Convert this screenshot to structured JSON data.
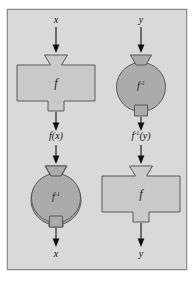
{
  "figure": {
    "frame": {
      "border_color": "#8d8d8d",
      "background_color": "#d9d9d9",
      "page_color": "#ffffff"
    },
    "colors": {
      "machine_f_fill": "#c9c9c9",
      "machine_f_inverse_fill": "#ababab",
      "outline": "#5a5a5a",
      "arrow": "#111111",
      "text": "#111111"
    }
  },
  "columns": [
    {
      "id": "left-chain",
      "description": "x enters f, yields f(x), which enters f inverse, returning x",
      "input_label": "x",
      "stage1_machine": "f",
      "intermediate_label_parts": {
        "base": "f(x)",
        "fn": "f",
        "arg": "(x)"
      },
      "stage2_machine": "f⁻¹",
      "output_label": "x"
    },
    {
      "id": "right-chain",
      "description": "y enters f inverse, yields f inverse of y, which enters f, returning y",
      "input_label": "y",
      "stage1_machine": "f⁻¹",
      "intermediate_label_parts": {
        "base": "f",
        "sup": "-1",
        "arg": "(y)"
      },
      "stage2_machine": "f",
      "output_label": "y"
    }
  ],
  "machines": {
    "f": {
      "name": "f",
      "shape": "funnel-box-spout",
      "kind": "function-machine"
    },
    "f_inverse": {
      "name": "f",
      "superscript": "-1",
      "shape": "funnel-circle-spout",
      "kind": "inverse-function-machine"
    }
  },
  "labels": {
    "left_input": "x",
    "left_intermediate_fn": "f",
    "left_intermediate_arg": "(x)",
    "left_output": "x",
    "right_input": "y",
    "right_intermediate_fn": "f",
    "right_intermediate_sup": "-1",
    "right_intermediate_arg": "(y)",
    "right_output": "y",
    "machine_f_name": "f",
    "machine_finv_name": "f",
    "machine_finv_sup": "-1"
  }
}
